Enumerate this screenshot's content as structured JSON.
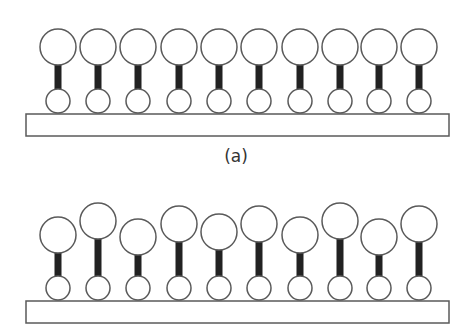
{
  "colors": {
    "background": "#ffffff",
    "outline": "#5a5a5a",
    "stem": "#222222",
    "label": "#333333"
  },
  "panels": [
    {
      "id": "a",
      "label": "(a)",
      "label_position": {
        "x": 236,
        "y": 162
      },
      "substrate": {
        "x": 26,
        "y": 114,
        "width": 423,
        "height": 22
      },
      "small_circle_radius": 12,
      "large_circle_radius": 18,
      "stem_width": 7,
      "molecules": [
        {
          "x": 58,
          "head_y": 47,
          "base_y": 101
        },
        {
          "x": 98,
          "head_y": 47,
          "base_y": 101
        },
        {
          "x": 138,
          "head_y": 47,
          "base_y": 101
        },
        {
          "x": 179,
          "head_y": 47,
          "base_y": 101
        },
        {
          "x": 219,
          "head_y": 47,
          "base_y": 101
        },
        {
          "x": 259,
          "head_y": 47,
          "base_y": 101
        },
        {
          "x": 300,
          "head_y": 47,
          "base_y": 101
        },
        {
          "x": 340,
          "head_y": 47,
          "base_y": 101
        },
        {
          "x": 379,
          "head_y": 47,
          "base_y": 101
        },
        {
          "x": 419,
          "head_y": 47,
          "base_y": 101
        }
      ]
    },
    {
      "id": "b",
      "label": "",
      "substrate": {
        "x": 26,
        "y": 301,
        "width": 423,
        "height": 22
      },
      "small_circle_radius": 12,
      "large_circle_radius": 18,
      "stem_width": 7,
      "molecules": [
        {
          "x": 58,
          "head_y": 235,
          "base_y": 288
        },
        {
          "x": 98,
          "head_y": 221,
          "base_y": 288
        },
        {
          "x": 138,
          "head_y": 237,
          "base_y": 288
        },
        {
          "x": 179,
          "head_y": 224,
          "base_y": 288
        },
        {
          "x": 219,
          "head_y": 232,
          "base_y": 288
        },
        {
          "x": 259,
          "head_y": 224,
          "base_y": 288
        },
        {
          "x": 300,
          "head_y": 235,
          "base_y": 288
        },
        {
          "x": 340,
          "head_y": 221,
          "base_y": 288
        },
        {
          "x": 379,
          "head_y": 237,
          "base_y": 288
        },
        {
          "x": 419,
          "head_y": 224,
          "base_y": 288
        }
      ]
    }
  ]
}
